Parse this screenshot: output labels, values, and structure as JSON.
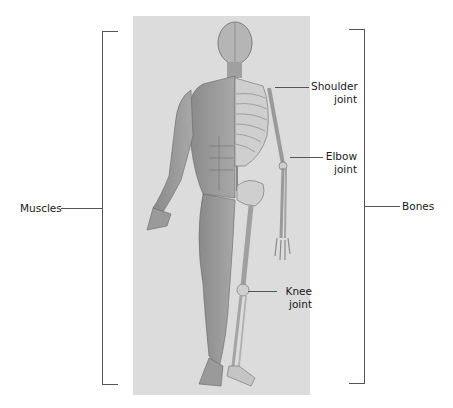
{
  "diagram": {
    "brackets": {
      "left": {
        "label": "Muscles"
      },
      "right": {
        "label": "Bones"
      }
    },
    "callouts": [
      {
        "id": "shoulder",
        "line1": "Shoulder",
        "line2": "joint"
      },
      {
        "id": "elbow",
        "line1": "Elbow",
        "line2": "joint"
      },
      {
        "id": "knee",
        "line1": "Knee",
        "line2": "joint"
      }
    ],
    "colors": {
      "panel_bg": "#dcdcdc",
      "line": "#555555",
      "text": "#1a1a1a"
    }
  }
}
